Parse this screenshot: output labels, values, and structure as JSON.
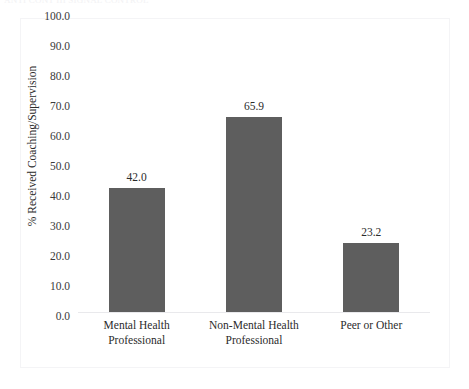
{
  "artifacts": {
    "top_clipped_text": "ANTI CONT III  SIGNAL CONTROL"
  },
  "chart_data": {
    "type": "bar",
    "title": "",
    "xlabel": "",
    "ylabel": "% Received Coaching/Supervision",
    "categories": [
      "Mental Health Professional",
      "Non-Mental Health Professional",
      "Peer or Other"
    ],
    "category_lines": [
      [
        "Mental Health",
        "Professional"
      ],
      [
        "Non-Mental Health",
        "Professional"
      ],
      [
        "Peer or Other",
        ""
      ]
    ],
    "values": [
      65.9,
      23.2,
      42.0
    ],
    "value_labels": [
      "65.9",
      "23.2",
      "42.0"
    ],
    "ylim": [
      0.0,
      100.0
    ],
    "ytick_values": [
      100.0,
      90.0,
      80.0,
      70.0,
      60.0,
      50.0,
      40.0,
      30.0,
      20.0,
      10.0,
      0.0
    ],
    "ytick_labels": [
      "100.0",
      "90.0",
      "80.0",
      "70.0",
      "60.0",
      "50.0",
      "40.0",
      "30.0",
      "20.0",
      "10.0",
      "0.0"
    ],
    "grid": false,
    "legend": false,
    "legend_position": "none",
    "colors": {
      "bar": "#5E5E5E",
      "text": "#2B2B2B",
      "tick_text": "#3A3A3A",
      "axis_line": "#E9E9EC",
      "frame_border": "#F4F4F6",
      "background": "#FFFFFF"
    }
  }
}
